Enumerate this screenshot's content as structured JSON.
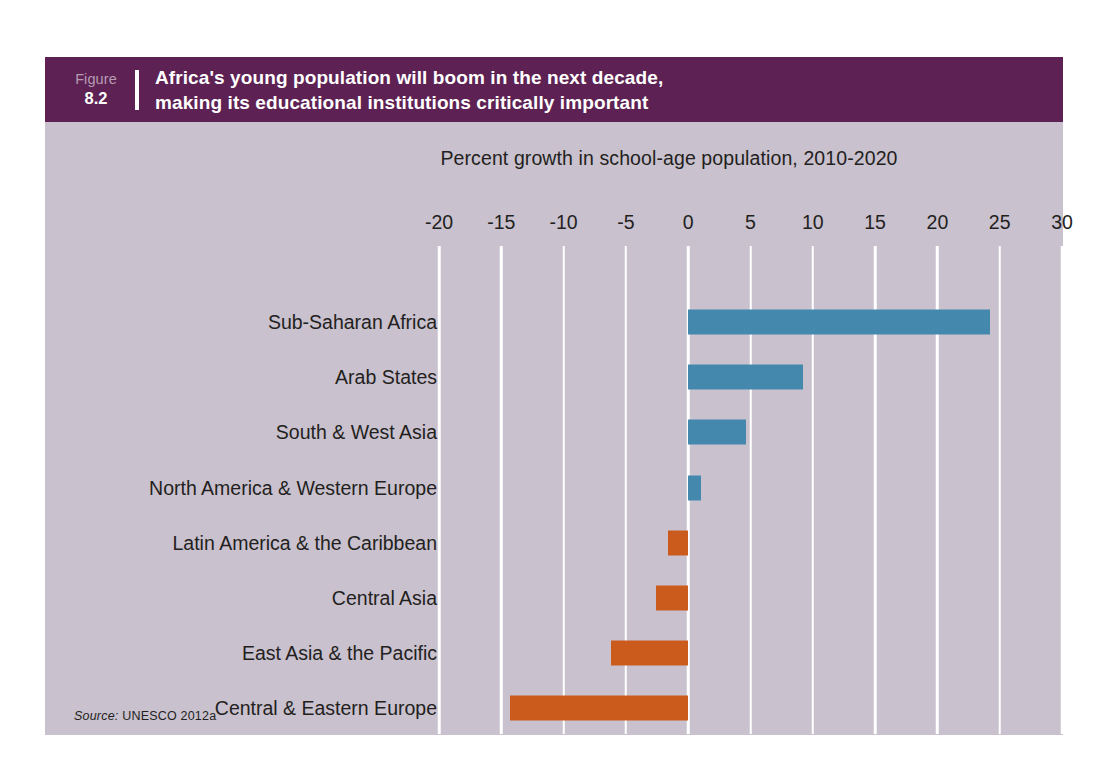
{
  "figure": {
    "label_word": "Figure",
    "number": "8.2",
    "title_line_1": "Africa's young population will boom in the next decade,",
    "title_line_2": "making its educational institutions critically important",
    "header_color": "#5d2253",
    "card_background": "#c9c1ce"
  },
  "source": {
    "label": "Source:",
    "text": "UNESCO 2012a"
  },
  "chart_data": {
    "type": "bar",
    "orientation": "horizontal",
    "title": "",
    "xlabel": "Percent growth in school-age population, 2010-2020",
    "ylabel": "",
    "xlim": [
      -20,
      30
    ],
    "xticks": [
      -20,
      -15,
      -10,
      -5,
      0,
      5,
      10,
      15,
      20,
      25,
      30
    ],
    "xtick_labels": [
      "-20",
      "-15",
      "-10",
      "-5",
      "0",
      "5",
      "10",
      "15",
      "20",
      "25",
      "30"
    ],
    "grid": true,
    "grid_color": "#ffffff",
    "legend": "none",
    "positive_color": "#4489ad",
    "negative_color": "#cb5b1d",
    "categories": [
      "Sub-Saharan Africa",
      "Arab States",
      "South & West Asia",
      "North America & Western Europe",
      "Latin America & the Caribbean",
      "Central Asia",
      "East Asia & the Pacific",
      "Central & Eastern Europe"
    ],
    "values": [
      24.2,
      9.2,
      4.6,
      1.0,
      -1.6,
      -2.6,
      -6.2,
      -14.3
    ]
  }
}
